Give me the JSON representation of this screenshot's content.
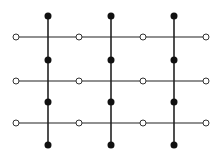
{
  "diagram": {
    "type": "lattice",
    "colors": {
      "background": "#ffffff",
      "line": "#222222",
      "filled_node": "#111111",
      "open_node_fill": "#ffffff",
      "open_node_stroke": "#333333"
    },
    "vertical_lines": [
      {
        "x": 48,
        "y1": 16,
        "y2": 145
      },
      {
        "x": 111,
        "y1": 16,
        "y2": 145
      },
      {
        "x": 174,
        "y1": 16,
        "y2": 145
      }
    ],
    "horizontal_lines": [
      {
        "y": 37,
        "x1": 16,
        "x2": 206
      },
      {
        "y": 81,
        "x1": 16,
        "x2": 206
      },
      {
        "y": 123,
        "x1": 16,
        "x2": 206
      }
    ],
    "filled_node_rows_y": [
      16,
      60,
      102,
      145
    ],
    "open_node_cols_x": [
      16,
      79,
      143,
      206
    ],
    "filled_node_radius": 3.5,
    "open_node_radius": 3
  }
}
